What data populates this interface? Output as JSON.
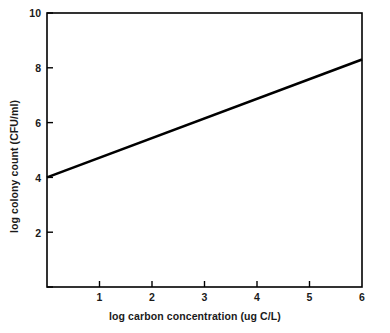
{
  "chart_data": {
    "type": "line",
    "title": "",
    "xlabel": "log carbon concentration (ug C/L)",
    "ylabel": "log colony count (CFU/ml)",
    "xlim": [
      0,
      6
    ],
    "ylim": [
      0,
      10
    ],
    "grid": false,
    "legend": null,
    "xticks": [
      0,
      1,
      2,
      3,
      4,
      5,
      6
    ],
    "xtick_labels": [
      "",
      "1",
      "2",
      "3",
      "4",
      "5",
      "6"
    ],
    "yticks": [
      0,
      2,
      4,
      6,
      8,
      10
    ],
    "ytick_labels": [
      "",
      "2",
      "4",
      "6",
      "8",
      "10"
    ],
    "series": [
      {
        "name": "colony count vs carbon",
        "color": "#000000",
        "x": [
          0,
          1,
          2,
          3,
          4,
          5,
          6
        ],
        "values": [
          4.0,
          4.72,
          5.43,
          6.15,
          6.87,
          7.58,
          8.3
        ],
        "endpoints": [
          [
            0,
            4.0
          ],
          [
            6,
            8.3
          ]
        ],
        "slope": 0.717,
        "intercept": 4.0
      }
    ]
  },
  "axes": {
    "x_title": "log carbon concentration (ug C/L)",
    "y_title": "log colony count (CFU/ml)",
    "x_tick_1": "1",
    "x_tick_2": "2",
    "x_tick_3": "3",
    "x_tick_4": "4",
    "x_tick_5": "5",
    "x_tick_6": "6",
    "y_tick_2": "2",
    "y_tick_4": "4",
    "y_tick_6": "6",
    "y_tick_8": "8",
    "y_tick_10": "10"
  },
  "colors": {
    "line": "#000000",
    "frame": "#000000",
    "background": "#ffffff",
    "text": "#1a1a1a"
  }
}
